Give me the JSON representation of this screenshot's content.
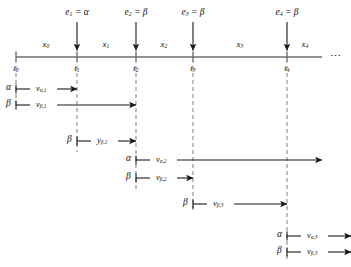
{
  "figure": {
    "type": "timeline-diagram",
    "axis": {
      "name": "time-axis",
      "start_x": 16,
      "end_x": 322,
      "y": 57,
      "continuation": "⋯"
    },
    "ticks": [
      {
        "id": "t0",
        "label": "t",
        "sub": "0",
        "x": 16
      },
      {
        "id": "t1",
        "label": "t",
        "sub": "1",
        "x": 77
      },
      {
        "id": "t2",
        "label": "t",
        "sub": "2",
        "x": 136
      },
      {
        "id": "t3",
        "label": "t",
        "sub": "3",
        "x": 193
      },
      {
        "id": "t4",
        "label": "t",
        "sub": "4",
        "x": 287
      }
    ],
    "intervals": [
      {
        "id": "x0",
        "label": "x",
        "sub": "0",
        "x": 46
      },
      {
        "id": "x1",
        "label": "x",
        "sub": "1",
        "x": 106
      },
      {
        "id": "x2",
        "label": "x",
        "sub": "2",
        "x": 164
      },
      {
        "id": "x3",
        "label": "x",
        "sub": "3",
        "x": 240
      },
      {
        "id": "x4",
        "label": "x",
        "sub": "4",
        "x": 305
      }
    ],
    "events": [
      {
        "id": "e1",
        "label": "e",
        "sub": "1",
        "equals": "=",
        "value": "α",
        "x": 77
      },
      {
        "id": "e2",
        "label": "e",
        "sub": "2",
        "equals": "=",
        "value": "β",
        "x": 136
      },
      {
        "id": "e3",
        "label": "e",
        "sub": "3",
        "equals": "=",
        "value": "β",
        "x": 193
      },
      {
        "id": "e4",
        "label": "e",
        "sub": "4",
        "equals": "=",
        "value": "β",
        "x": 287
      }
    ],
    "dashed_lines": [
      {
        "id": "dash-t0",
        "x": 16,
        "y1": 66,
        "y2": 108
      },
      {
        "id": "dash-t1",
        "x": 77,
        "y1": 66,
        "y2": 152
      },
      {
        "id": "dash-t2",
        "x": 136,
        "y1": 66,
        "y2": 190
      },
      {
        "id": "dash-t3",
        "x": 193,
        "y1": 66,
        "y2": 213
      },
      {
        "id": "dash-t4",
        "x": 287,
        "y1": 66,
        "y2": 262
      }
    ],
    "measures": [
      {
        "id": "v-alpha-1",
        "greek": "α",
        "label": "v",
        "sub": "α,1",
        "y": 89,
        "from_x": 16,
        "to_x": 77,
        "greek_x": 6,
        "label_x": 36
      },
      {
        "id": "v-beta-1",
        "greek": "β",
        "label": "v",
        "sub": "β,1",
        "y": 105,
        "from_x": 16,
        "to_x": 136,
        "greek_x": 6,
        "label_x": 36
      },
      {
        "id": "y-beta-1",
        "greek": "β",
        "label": "y",
        "sub": "β,1",
        "y": 141,
        "from_x": 77,
        "to_x": 136,
        "greek_x": 67,
        "label_x": 97
      },
      {
        "id": "v-alpha-2",
        "greek": "α",
        "label": "v",
        "sub": "α,2",
        "y": 160,
        "from_x": 136,
        "to_x": 322,
        "greek_x": 126,
        "label_x": 156
      },
      {
        "id": "v-beta-2",
        "greek": "β",
        "label": "v",
        "sub": "β,2",
        "y": 178,
        "from_x": 136,
        "to_x": 193,
        "greek_x": 126,
        "label_x": 156
      },
      {
        "id": "v-beta-3",
        "greek": "β",
        "label": "v",
        "sub": "β,3",
        "y": 204,
        "from_x": 193,
        "to_x": 287,
        "greek_x": 183,
        "label_x": 213
      },
      {
        "id": "v-alpha-3-bottom",
        "greek": "α",
        "label": "v",
        "sub": "α,3",
        "y": 236,
        "from_x": 287,
        "to_x": 351,
        "greek_x": 277,
        "label_x": 307
      },
      {
        "id": "v-beta-3-bottom",
        "greek": "β",
        "label": "v",
        "sub": "β,3",
        "y": 252,
        "from_x": 287,
        "to_x": 351,
        "greek_x": 277,
        "label_x": 307
      }
    ],
    "colors": {
      "axis": "#6e6e6e",
      "arrow": "#1a1a1a",
      "dashed": "#8a8a8a",
      "text": "#111111",
      "background": "#ffffff"
    }
  }
}
